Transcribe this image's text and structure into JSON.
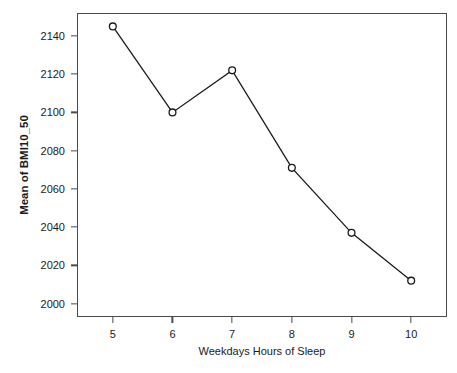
{
  "chart_data": {
    "type": "line",
    "title": "",
    "xlabel": "Weekdays Hours of Sleep",
    "ylabel": "Mean of BMI10_50",
    "x": [
      5,
      6,
      7,
      8,
      9,
      10
    ],
    "categories": [
      "5",
      "6",
      "7",
      "8",
      "9",
      "10"
    ],
    "values": [
      2145,
      2100,
      2122,
      2071,
      2037,
      2012
    ],
    "series": [
      {
        "name": "Mean of BMI10_50",
        "values": [
          2145,
          2100,
          2122,
          2071,
          2037,
          2012
        ]
      }
    ],
    "xlim": [
      4.4,
      10.6
    ],
    "ylim": [
      1993,
      2152
    ],
    "y_ticks": [
      2000,
      2020,
      2040,
      2060,
      2080,
      2100,
      2120,
      2140
    ],
    "y_tick_labels": [
      "2000",
      "2020",
      "2040",
      "2060",
      "2080",
      "2100",
      "2120",
      "2140"
    ],
    "x_ticks": [
      5,
      6,
      7,
      8,
      9,
      10
    ],
    "x_tick_labels": [
      "5",
      "6",
      "7",
      "8",
      "9",
      "10"
    ],
    "grid": false,
    "legend": "none",
    "marker": "open-circle",
    "line_color": "#1a1a1a",
    "marker_color": "#1a1a1a",
    "marker_fill": "#ffffff",
    "frame_color": "#4a4a4a",
    "background": "#ffffff"
  }
}
